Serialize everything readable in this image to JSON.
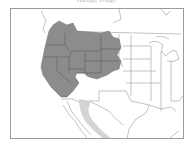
{
  "caption": "range map",
  "map": {
    "region": "Western North America",
    "legend_colors": {
      "primary_range": "#8c8c8c",
      "secondary_range": "#d4d4d4",
      "borders": "#7a7a7a",
      "range_borders": "#5e5e5e",
      "frame": "#9a9a9a"
    },
    "layers": [
      {
        "name": "primary-range",
        "description": "Western United States: Washington, Oregon, California, Idaho, Nevada, Utah, Arizona, Montana, Wyoming, Colorado, New Mexico, western Dakotas/Nebraska"
      },
      {
        "name": "secondary-range",
        "description": "Western Mexico coast (Sonora/Sinaloa)"
      }
    ]
  }
}
